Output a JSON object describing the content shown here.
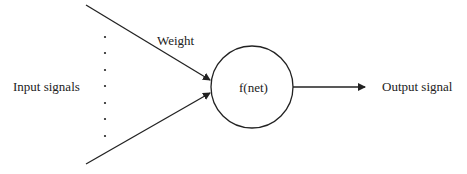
{
  "diagram": {
    "input_label": "Input signals",
    "weight_label": "Weight",
    "neuron_label": "f(net)",
    "output_label": "Output signal"
  }
}
